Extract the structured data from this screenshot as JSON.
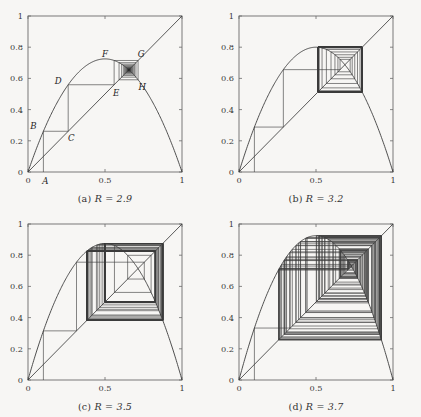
{
  "figure": {
    "background": "#f7f6f4",
    "line_color": "#3c3c3c",
    "axis_color": "#6b6b6b"
  },
  "chart_data": [
    {
      "type": "line",
      "panel": "a",
      "caption_prefix": "(a)",
      "caption_param": "R = 2.9",
      "R": 2.9,
      "title": "",
      "xlabel": "",
      "ylabel": "",
      "xlim": [
        0,
        1
      ],
      "ylim": [
        0,
        1
      ],
      "xticks": [
        0,
        0.5,
        1
      ],
      "xticklabels": [
        "0",
        "0.5",
        "1"
      ],
      "yticks": [
        0,
        0.2,
        0.4,
        0.6,
        0.8,
        1
      ],
      "yticklabels": [
        "0",
        "0.2",
        "0.4",
        "0.6",
        "0.8",
        "1"
      ],
      "grid": false,
      "legend": "none",
      "series": [
        {
          "name": "logistic-map",
          "desc": "f(x) = R x (1 - x)"
        },
        {
          "name": "identity",
          "desc": "y = x"
        },
        {
          "name": "cobweb",
          "desc": "cobweb iteration from x0",
          "x0": 0.1,
          "iterations": 60
        }
      ],
      "annotations": [
        {
          "label": "A",
          "x": 0.1,
          "y": 0.0,
          "dx": 2,
          "dy": 12
        },
        {
          "label": "B",
          "x": 0.1,
          "y": 0.261,
          "dx": -10,
          "dy": -2
        },
        {
          "label": "C",
          "x": 0.261,
          "y": 0.261,
          "dx": 3,
          "dy": 10
        },
        {
          "label": "D",
          "x": 0.261,
          "y": 0.5591,
          "dx": -10,
          "dy": -1
        },
        {
          "label": "E",
          "x": 0.5591,
          "y": 0.5591,
          "dx": 2,
          "dy": 11
        },
        {
          "label": "F",
          "x": 0.5591,
          "y": 0.7152,
          "dx": -9,
          "dy": -3
        },
        {
          "label": "G",
          "x": 0.7152,
          "y": 0.7152,
          "dx": 3,
          "dy": -3
        },
        {
          "label": "H",
          "x": 0.7152,
          "y": 0.5904,
          "dx": 4,
          "dy": 10
        }
      ]
    },
    {
      "type": "line",
      "panel": "b",
      "caption_prefix": "(b)",
      "caption_param": "R = 3.2",
      "R": 3.2,
      "title": "",
      "xlabel": "",
      "ylabel": "",
      "xlim": [
        0,
        1
      ],
      "ylim": [
        0,
        1
      ],
      "xticks": [
        0,
        0.5,
        1
      ],
      "xticklabels": [
        "0",
        "0.5",
        "1"
      ],
      "yticks": [
        0,
        0.2,
        0.4,
        0.6,
        0.8,
        1
      ],
      "yticklabels": [
        "0",
        "0.2",
        "0.4",
        "0.6",
        "0.8",
        "1"
      ],
      "grid": false,
      "legend": "none",
      "series": [
        {
          "name": "logistic-map",
          "desc": "f(x) = R x (1 - x)"
        },
        {
          "name": "identity",
          "desc": "y = x"
        },
        {
          "name": "cobweb",
          "desc": "cobweb iteration from x0",
          "x0": 0.1,
          "iterations": 70
        }
      ],
      "annotations": []
    },
    {
      "type": "line",
      "panel": "c",
      "caption_prefix": "(c)",
      "caption_param": "R = 3.5",
      "R": 3.5,
      "title": "",
      "xlabel": "",
      "ylabel": "",
      "xlim": [
        0,
        1
      ],
      "ylim": [
        0,
        1
      ],
      "xticks": [
        0,
        0.5,
        1
      ],
      "xticklabels": [
        "0",
        "0.5",
        "1"
      ],
      "yticks": [
        0,
        0.2,
        0.4,
        0.6,
        0.8,
        1
      ],
      "yticklabels": [
        "0",
        "0.2",
        "0.4",
        "0.6",
        "0.8",
        "1"
      ],
      "grid": false,
      "legend": "none",
      "series": [
        {
          "name": "logistic-map",
          "desc": "f(x) = R x (1 - x)"
        },
        {
          "name": "identity",
          "desc": "y = x"
        },
        {
          "name": "cobweb",
          "desc": "cobweb iteration from x0",
          "x0": 0.1,
          "iterations": 90
        }
      ],
      "annotations": []
    },
    {
      "type": "line",
      "panel": "d",
      "caption_prefix": "(d)",
      "caption_param": "R = 3.7",
      "R": 3.7,
      "title": "",
      "xlabel": "",
      "ylabel": "",
      "xlim": [
        0,
        1
      ],
      "ylim": [
        0,
        1
      ],
      "xticks": [
        0,
        0.5,
        1
      ],
      "xticklabels": [
        "0",
        "0.5",
        "1"
      ],
      "yticks": [
        0,
        0.2,
        0.4,
        0.6,
        0.8,
        1
      ],
      "yticklabels": [
        "0",
        "0.2",
        "0.4",
        "0.6",
        "0.8",
        "1"
      ],
      "grid": false,
      "legend": "none",
      "series": [
        {
          "name": "logistic-map",
          "desc": "f(x) = R x (1 - x)"
        },
        {
          "name": "identity",
          "desc": "y = x"
        },
        {
          "name": "cobweb",
          "desc": "cobweb iteration from x0",
          "x0": 0.1,
          "iterations": 110
        }
      ],
      "annotations": []
    }
  ]
}
